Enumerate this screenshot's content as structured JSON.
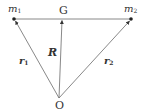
{
  "diagram": {
    "colors": {
      "line": "#555555",
      "point": "#222222",
      "text": "#333333"
    },
    "points": {
      "m1": {
        "label": "m",
        "sub": "1",
        "x": 14,
        "y": 19
      },
      "m2": {
        "label": "m",
        "sub": "2",
        "x": 131,
        "y": 19
      },
      "G": {
        "label": "G",
        "x": 62,
        "y": 19
      },
      "O": {
        "label": "O",
        "x": 59,
        "y": 98
      }
    },
    "vectors": {
      "r1": {
        "label": "r",
        "sub": "1",
        "from": "O",
        "to": "m1"
      },
      "r2": {
        "label": "r",
        "sub": "2",
        "from": "O",
        "to": "m2"
      },
      "R": {
        "label": "R",
        "from": "O",
        "to": "G"
      }
    },
    "segments": [
      {
        "from": "m1",
        "to": "m2",
        "name": "m1-m2-line"
      }
    ]
  }
}
